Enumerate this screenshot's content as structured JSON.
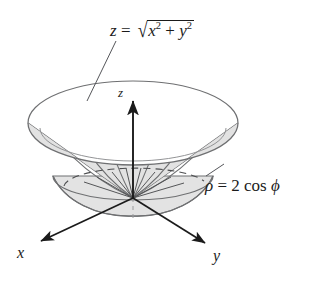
{
  "figure": {
    "background_color": "#ffffff",
    "ink_color": "#1b1b1b",
    "surface_line_color": "#6f7072",
    "surface_fill_color": "#e8e8e8",
    "surface_fill_color_dark": "#dedede"
  },
  "labels": {
    "cone_equation": {
      "lhs": "z",
      "equals": "=",
      "radical": "√",
      "term1_base": "x",
      "term1_exp": "2",
      "plus": "+",
      "term2_base": "y",
      "term2_exp": "2",
      "plain": "z = √(x² + y²)"
    },
    "sphere_equation": {
      "lhs": "ρ",
      "equals": "=",
      "coefficient": "2",
      "function": "cos",
      "argument": "ϕ",
      "plain": "ρ = 2 cos ϕ"
    },
    "axis_x": "x",
    "axis_y": "y",
    "axis_z": "z"
  },
  "geometry": {
    "origin": {
      "x": 133,
      "y": 198
    },
    "cone_rim": {
      "cx": 133,
      "cy": 123,
      "rx": 105,
      "ry": 42
    },
    "sphere_equator": {
      "cx": 133,
      "cy": 176,
      "rx": 80,
      "ry": 22
    },
    "axes": {
      "z_tip": {
        "x": 133,
        "y": 99
      },
      "x_tip": {
        "x": 38,
        "y": 243
      },
      "y_tip": {
        "x": 207,
        "y": 245
      }
    }
  }
}
